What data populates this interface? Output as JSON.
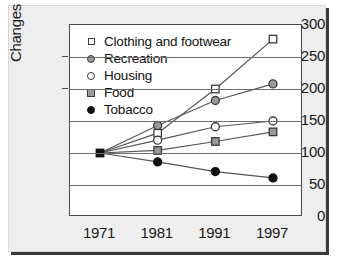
{
  "chart_data": {
    "type": "line",
    "title": "",
    "xlabel": "",
    "ylabel": "Changes from 1971",
    "categories": [
      "1971",
      "1981",
      "1991",
      "1997"
    ],
    "ylim": [
      0,
      300
    ],
    "yticks": [
      0,
      50,
      100,
      150,
      200,
      250,
      300
    ],
    "ytick_labels": [
      "0",
      "50",
      "100",
      "150",
      "200",
      "250",
      "300"
    ],
    "grid": true,
    "legend_position": "upper-left-inside",
    "series": [
      {
        "name": "Clothing and footwear",
        "marker": "open-square",
        "marker_fill": "#ffffff",
        "marker_edge": "#3a3a3a",
        "line_color": "#555555",
        "values": [
          100,
          131,
          200,
          278
        ]
      },
      {
        "name": "Recreation",
        "marker": "filled-circle",
        "marker_fill": "#9a9a9a",
        "marker_edge": "#3a3a3a",
        "line_color": "#555555",
        "values": [
          100,
          143,
          182,
          208
        ]
      },
      {
        "name": "Housing",
        "marker": "open-circle",
        "marker_fill": "#ffffff",
        "marker_edge": "#3a3a3a",
        "line_color": "#555555",
        "values": [
          100,
          120,
          141,
          150
        ]
      },
      {
        "name": "Food",
        "marker": "filled-square",
        "marker_fill": "#9a9a9a",
        "marker_edge": "#3a3a3a",
        "line_color": "#555555",
        "values": [
          100,
          104,
          118,
          133
        ]
      },
      {
        "name": "Tobacco",
        "marker": "filled-circle",
        "marker_fill": "#111111",
        "marker_edge": "#111111",
        "line_color": "#555555",
        "values": [
          100,
          86,
          71,
          61
        ]
      }
    ],
    "origin_marker": {
      "label": "1971 baseline",
      "shape": "filled-square",
      "color": "#111111",
      "value": 100
    }
  },
  "colors": {
    "figure_background": "#eeeeee",
    "plot_background": "#ffffff",
    "axis": "#4a4a4a",
    "gridline": "#6e6e6e",
    "text": "#1a1a1a",
    "shadow": "#3a3a3a"
  }
}
